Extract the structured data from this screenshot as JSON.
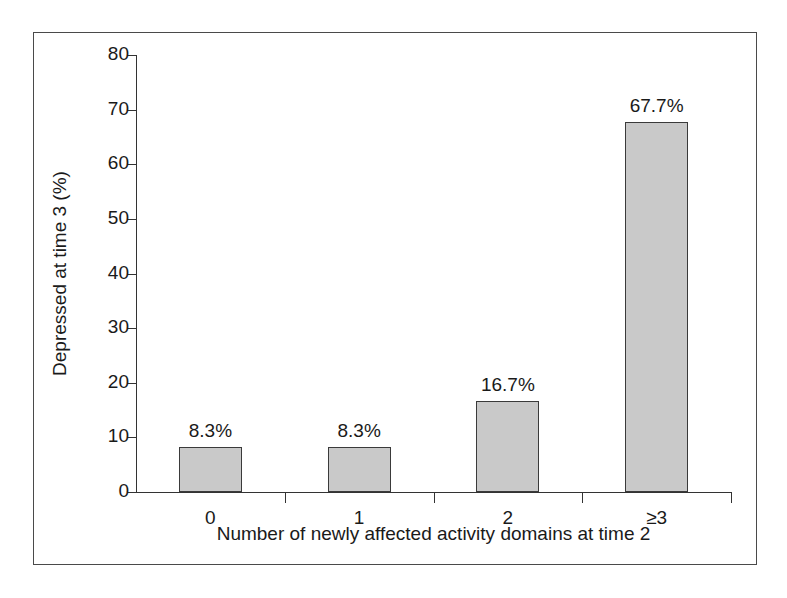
{
  "chart_data": {
    "type": "bar",
    "title": "",
    "xlabel": "Number of newly affected activity domains at time 2",
    "ylabel": "Depressed at time 3 (%)",
    "categories": [
      "0",
      "1",
      "2",
      "≥3"
    ],
    "values": [
      8.3,
      8.3,
      16.7,
      67.7
    ],
    "value_labels": [
      "8.3%",
      "8.3%",
      "16.7%",
      "67.7%"
    ],
    "ylim": [
      0,
      80
    ],
    "ytick_labels": [
      "0",
      "10",
      "20",
      "30",
      "40",
      "50",
      "60",
      "70",
      "80"
    ],
    "ytick_values": [
      0,
      10,
      20,
      30,
      40,
      50,
      60,
      70,
      80
    ],
    "grid": false,
    "legend": "none",
    "bar_fill_color": "#c9c9c9",
    "bar_border_color": "#3a3a3a",
    "axis_color": "#333333",
    "frame_color": "#4a4a4a",
    "background_color": "#ffffff"
  }
}
